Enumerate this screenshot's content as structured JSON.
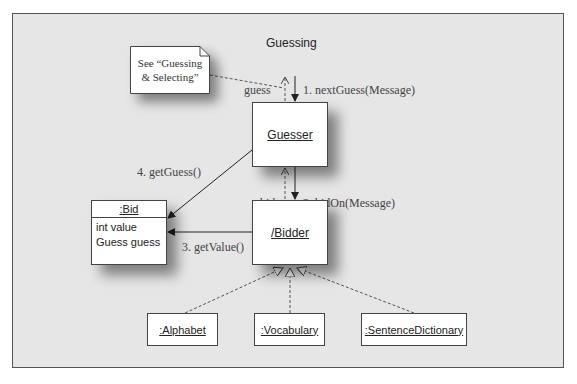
{
  "diagram": {
    "title": "Guessing",
    "note": {
      "line1": "See “Guessing",
      "line2": "& Selecting”"
    },
    "objects": {
      "guesser": "Guesser",
      "bidder": "/Bidder",
      "bid": {
        "name": ":Bid",
        "attributes": [
          "int value",
          "Guess guess"
        ]
      },
      "alphabet": ":Alphabet",
      "vocabulary": ":Vocabulary",
      "sentence_dictionary": ":SentenceDictionary"
    },
    "messages": {
      "m1": "1. nextGuess(Message)",
      "m2": "2. bidOn(Message)",
      "m3": "3. getValue()",
      "m4": "4. getGuess()"
    },
    "returns": {
      "guess": "guess",
      "bid": "bid"
    },
    "colors": {
      "background": "#e6e6e6",
      "box": "#ffffff",
      "line": "#333333"
    }
  }
}
